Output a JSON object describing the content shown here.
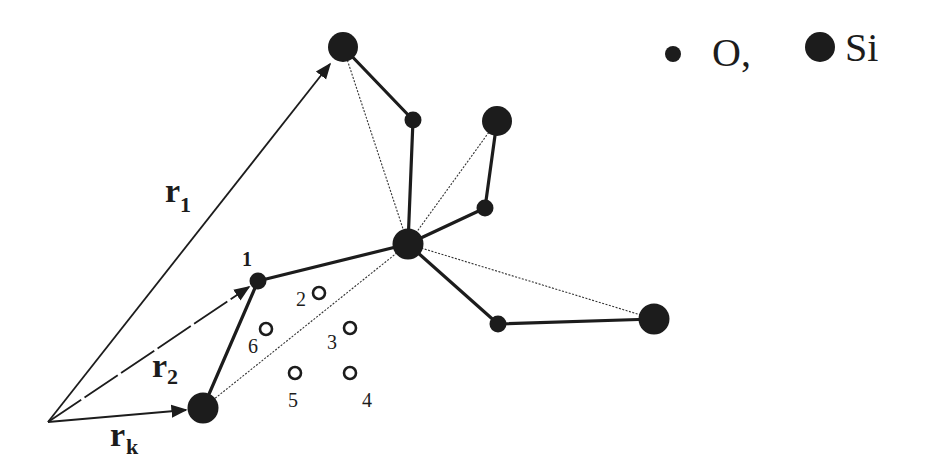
{
  "legend": {
    "oxygen_label": "O,",
    "silicon_label": "Si"
  },
  "vectors": {
    "r1": {
      "base": "r",
      "sub": "1"
    },
    "r2": {
      "base": "r",
      "sub": "2"
    },
    "rk": {
      "base": "r",
      "sub": "k"
    }
  },
  "site_labels": {
    "atom1": "1",
    "s2": "2",
    "s3": "3",
    "s4": "4",
    "s5": "5",
    "s6": "6"
  },
  "colors": {
    "atom": "#1c1c1c",
    "background": "#ffffff"
  }
}
